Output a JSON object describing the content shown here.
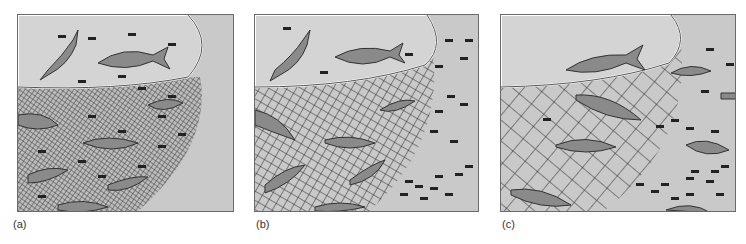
{
  "figure": {
    "panels": [
      {
        "id": "a",
        "label": "(a)",
        "mesh": "fine",
        "description": "Fine-mesh net catches large and small fish"
      },
      {
        "id": "b",
        "label": "(b)",
        "mesh": "medium",
        "description": "Medium-mesh net; small fish escape"
      },
      {
        "id": "c",
        "label": "(c)",
        "mesh": "coarse",
        "description": "Coarse-mesh net; small and medium fish escape"
      }
    ],
    "colors": {
      "water": "#c9c9c9",
      "surface": "#d4d4d4",
      "net": "#2a2a2a",
      "fish": "#444444",
      "border": "#6a6a6a"
    }
  }
}
